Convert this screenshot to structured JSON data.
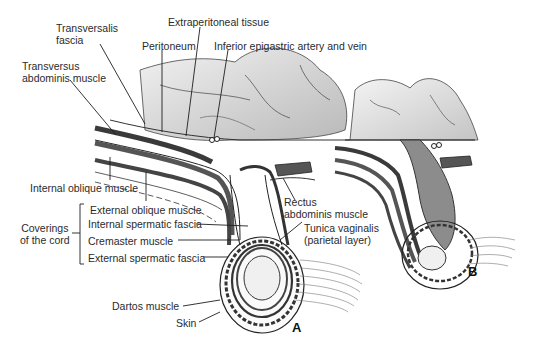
{
  "figure": {
    "panels": [
      {
        "id": "A",
        "label": "A"
      },
      {
        "id": "B",
        "label": "B"
      }
    ],
    "labels": {
      "transversalis_fascia": [
        "Transversalis",
        "fascia"
      ],
      "extraperitoneal_tissue": "Extraperitoneal tissue",
      "peritoneum": "Peritoneum",
      "inferior_epigastric": "Inferior epigastric artery and vein",
      "transversus_abdominis": [
        "Transversus",
        "abdominis muscle"
      ],
      "internal_oblique": "Internal oblique muscle",
      "external_oblique": "External oblique muscle",
      "coverings_of_cord": [
        "Coverings",
        "of the cord"
      ],
      "internal_spermatic_fascia": "Internal spermatic fascia",
      "cremaster_muscle": "Cremaster muscle",
      "external_spermatic_fascia": "External spermatic fascia",
      "rectus_abdominis": [
        "Rectus",
        "abdominis muscle"
      ],
      "tunica_vaginalis": [
        "Tunica vaginalis",
        "(parietal layer)"
      ],
      "dartos_muscle": "Dartos muscle",
      "skin": "Skin"
    },
    "colors": {
      "intestine_fill": "#d6d6d6",
      "muscle_dark": "#4a4a4a",
      "hernia_sac_fill": "#8c8c8c",
      "line": "#222222"
    }
  }
}
